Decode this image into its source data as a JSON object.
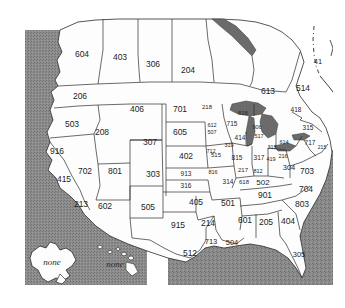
{
  "figure": {
    "kind": "map",
    "projection_note": "continental US with Alaska and Hawaii insets at lower left"
  },
  "colors": {
    "page_background": "#ffffff",
    "ocean": "#8d8d8d",
    "ocean_speckle": "#6f6f6f",
    "land_fill": "#fdfdfd",
    "border_stroke": "#2b2b2b",
    "lake_fill": "#6b6b6b",
    "label_text": "#1d1d1d",
    "inset_text": "#2a2a2a"
  },
  "legend": {
    "alaska_label": "none",
    "hawaii_label": "none"
  },
  "area_codes": [
    {
      "code": "604",
      "region": "British Columbia",
      "x": 82,
      "y": 55,
      "size": 8.5
    },
    {
      "code": "403",
      "region": "Alberta",
      "x": 120,
      "y": 58,
      "size": 8.5
    },
    {
      "code": "306",
      "region": "Saskatchewan",
      "x": 153,
      "y": 65,
      "size": 8.5
    },
    {
      "code": "204",
      "region": "Manitoba",
      "x": 188,
      "y": 71,
      "size": 8.5
    },
    {
      "code": "613",
      "region": "Ontario",
      "x": 268,
      "y": 92,
      "size": 8.5
    },
    {
      "code": "514",
      "region": "Quebec",
      "x": 303,
      "y": 89,
      "size": 8.5
    },
    {
      "code": "41",
      "region": "Quebec east",
      "x": 318,
      "y": 62,
      "size": 7.5
    },
    {
      "code": "206",
      "region": "Washington",
      "x": 80,
      "y": 97,
      "size": 8.5
    },
    {
      "code": "503",
      "region": "Oregon",
      "x": 72,
      "y": 125,
      "size": 8.5
    },
    {
      "code": "916",
      "region": "N California",
      "x": 57,
      "y": 152,
      "size": 8.5
    },
    {
      "code": "415",
      "region": "C California",
      "x": 64,
      "y": 180,
      "size": 8.5
    },
    {
      "code": "213",
      "region": "S California",
      "x": 81,
      "y": 205,
      "size": 8.5
    },
    {
      "code": "208",
      "region": "Idaho",
      "x": 102,
      "y": 133,
      "size": 8.5
    },
    {
      "code": "702",
      "region": "Nevada",
      "x": 85,
      "y": 172,
      "size": 8.5
    },
    {
      "code": "406",
      "region": "Montana",
      "x": 137,
      "y": 110,
      "size": 8.5
    },
    {
      "code": "307",
      "region": "Wyoming",
      "x": 150,
      "y": 143,
      "size": 8.5
    },
    {
      "code": "801",
      "region": "Utah",
      "x": 115,
      "y": 172,
      "size": 8.5
    },
    {
      "code": "303",
      "region": "Colorado",
      "x": 153,
      "y": 175,
      "size": 8.5
    },
    {
      "code": "602",
      "region": "Arizona",
      "x": 105,
      "y": 207,
      "size": 8.5
    },
    {
      "code": "505",
      "region": "New Mexico",
      "x": 148,
      "y": 208,
      "size": 8.5
    },
    {
      "code": "701",
      "region": "North Dakota",
      "x": 180,
      "y": 110,
      "size": 8.5
    },
    {
      "code": "605",
      "region": "South Dakota",
      "x": 180,
      "y": 133,
      "size": 8.5
    },
    {
      "code": "402",
      "region": "Nebraska",
      "x": 186,
      "y": 157,
      "size": 8.5
    },
    {
      "code": "913",
      "region": "N Kansas",
      "x": 186,
      "y": 174,
      "size": 6.5
    },
    {
      "code": "316",
      "region": "S Kansas",
      "x": 186,
      "y": 186,
      "size": 6.5
    },
    {
      "code": "405",
      "region": "Oklahoma",
      "x": 196,
      "y": 203,
      "size": 8.5
    },
    {
      "code": "915",
      "region": "West Texas",
      "x": 178,
      "y": 226,
      "size": 8.5
    },
    {
      "code": "214",
      "region": "North Texas",
      "x": 208,
      "y": 224,
      "size": 8.5
    },
    {
      "code": "713",
      "region": "SE Texas",
      "x": 211,
      "y": 242,
      "size": 7.5
    },
    {
      "code": "512",
      "region": "South Texas",
      "x": 190,
      "y": 254,
      "size": 8.5
    },
    {
      "code": "218",
      "region": "N Minnesota",
      "x": 207,
      "y": 107,
      "size": 6.0
    },
    {
      "code": "616",
      "region": "W Michigan",
      "x": 243,
      "y": 113,
      "size": 6.0
    },
    {
      "code": "715",
      "region": "N Wisconsin",
      "x": 232,
      "y": 124,
      "size": 6.5
    },
    {
      "code": "612",
      "region": "S Minnesota",
      "x": 212,
      "y": 126,
      "size": 5.5
    },
    {
      "code": "507",
      "region": "SW Minnesota",
      "x": 212,
      "y": 133,
      "size": 5.5
    },
    {
      "code": "414",
      "region": "S Wisconsin",
      "x": 240,
      "y": 138,
      "size": 6.5
    },
    {
      "code": "906",
      "region": "Upper Michigan",
      "x": 257,
      "y": 128,
      "size": 5.5
    },
    {
      "code": "517",
      "region": "C Michigan",
      "x": 259,
      "y": 137,
      "size": 5.5
    },
    {
      "code": "712",
      "region": "W Iowa",
      "x": 211,
      "y": 152,
      "size": 5.5
    },
    {
      "code": "319",
      "region": "E Iowa",
      "x": 229,
      "y": 146,
      "size": 5.5
    },
    {
      "code": "515",
      "region": "C Iowa",
      "x": 216,
      "y": 155,
      "size": 6.0
    },
    {
      "code": "815",
      "region": "N Illinois",
      "x": 237,
      "y": 158,
      "size": 6.5
    },
    {
      "code": "317",
      "region": "Indiana",
      "x": 259,
      "y": 158,
      "size": 6.5
    },
    {
      "code": "313",
      "region": "SE Michigan",
      "x": 272,
      "y": 148,
      "size": 5.5
    },
    {
      "code": "419",
      "region": "NW Ohio",
      "x": 271,
      "y": 160,
      "size": 5.5
    },
    {
      "code": "216",
      "region": "NE Ohio",
      "x": 283,
      "y": 157,
      "size": 5.5
    },
    {
      "code": "816",
      "region": "W Missouri",
      "x": 213,
      "y": 173,
      "size": 5.5
    },
    {
      "code": "217",
      "region": "C Illinois",
      "x": 243,
      "y": 170,
      "size": 6.0
    },
    {
      "code": "812",
      "region": "S Indiana",
      "x": 258,
      "y": 172,
      "size": 5.5
    },
    {
      "code": "314",
      "region": "E Missouri",
      "x": 228,
      "y": 182,
      "size": 6.5
    },
    {
      "code": "618",
      "region": "S Illinois",
      "x": 244,
      "y": 182,
      "size": 6.0
    },
    {
      "code": "502",
      "region": "Kentucky",
      "x": 263,
      "y": 183,
      "size": 8.0
    },
    {
      "code": "614",
      "region": "SE Ohio",
      "x": 284,
      "y": 143,
      "size": 5.5
    },
    {
      "code": "304",
      "region": "West Virginia",
      "x": 289,
      "y": 168,
      "size": 7.5
    },
    {
      "code": "418",
      "region": "Quebec south",
      "x": 296,
      "y": 110,
      "size": 6.5
    },
    {
      "code": "315",
      "region": "New York",
      "x": 308,
      "y": 128,
      "size": 6.5
    },
    {
      "code": "717",
      "region": "Pennsylvania",
      "x": 310,
      "y": 143,
      "size": 6.5
    },
    {
      "code": "215",
      "region": "E Pennsylvania",
      "x": 322,
      "y": 148,
      "size": 5.0
    },
    {
      "code": "703",
      "region": "Virginia",
      "x": 307,
      "y": 172,
      "size": 8.5
    },
    {
      "code": "901",
      "region": "Tennessee",
      "x": 265,
      "y": 196,
      "size": 8.5
    },
    {
      "code": "704",
      "region": "North Carolina",
      "x": 306,
      "y": 190,
      "size": 8.5
    },
    {
      "code": "803",
      "region": "South Carolina",
      "x": 302,
      "y": 205,
      "size": 8.5
    },
    {
      "code": "501",
      "region": "Arkansas",
      "x": 228,
      "y": 204,
      "size": 8.5
    },
    {
      "code": "601",
      "region": "Mississippi",
      "x": 245,
      "y": 221,
      "size": 8.5
    },
    {
      "code": "205",
      "region": "Alabama",
      "x": 266,
      "y": 223,
      "size": 8.5
    },
    {
      "code": "404",
      "region": "Georgia",
      "x": 288,
      "y": 222,
      "size": 8.5
    },
    {
      "code": "504",
      "region": "Louisiana",
      "x": 232,
      "y": 243,
      "size": 7.5
    },
    {
      "code": "305",
      "region": "Florida",
      "x": 299,
      "y": 255,
      "size": 7.5
    }
  ]
}
